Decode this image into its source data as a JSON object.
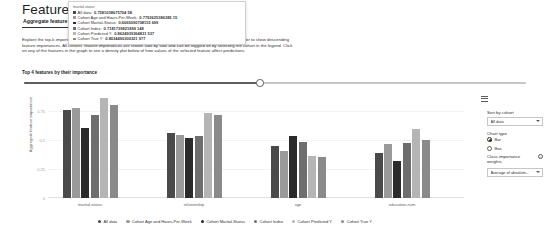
{
  "header": {
    "title": "Feature importances"
  },
  "tabs": [
    {
      "label": "Aggregate feature importance",
      "selected": true
    },
    {
      "label": "Individual feature importance",
      "selected": false
    }
  ],
  "description": "Explore the top-k important features that impact your overall model predictions (a.k.a. global explanation). Use the slider to show descending feature importances. All cohorts' feature importances are shown side by side and can be toggled off by selecting the cohort in the legend. Click on any of the features in the graph to see a density plot below of how values of the selected feature affect predictions.",
  "slider": {
    "label": "Top 4 features by their importance",
    "value": 4,
    "percent": 47
  },
  "tooltip": {
    "header": "marital-status",
    "rows": [
      {
        "series": "All data",
        "value": "0.7581038675704 58",
        "color": "#4a4a4a"
      },
      {
        "series": "Cohort Age and Hours-Per-Week",
        "value": "0.7793625386385 15",
        "color": "#9a9a9a"
      },
      {
        "series": "Cohort Marital-Status",
        "value": "0.6065090708115 699",
        "color": "#2b2b2b"
      },
      {
        "series": "Cohort Index",
        "value": "0.7181739821899 148",
        "color": "#6e6e6e"
      },
      {
        "series": "Cohort Predicted Y",
        "value": "0.8624939364831 537",
        "color": "#b5b5b5"
      },
      {
        "series": "Cohort True Y",
        "value": "0.8034490300321 977",
        "color": "#8a8a8a"
      }
    ]
  },
  "chart_data": {
    "type": "bar",
    "title": "",
    "xlabel": "",
    "ylabel": "Aggregate feature importance",
    "ylim": [
      0,
      0.9
    ],
    "yticks": [
      "0",
      "0.25",
      "0.5",
      "0.75"
    ],
    "ytickvals": [
      0,
      0.25,
      0.5,
      0.75
    ],
    "grid": false,
    "legend_position": "bottom",
    "categories": [
      "marital-status",
      "relationship",
      "age",
      "education-num"
    ],
    "series": [
      {
        "name": "All data",
        "color": "#4a4a4a",
        "values": [
          0.758,
          0.562,
          0.447,
          0.391
        ]
      },
      {
        "name": "Cohort Age and Hours-Per-Week",
        "color": "#9a9a9a",
        "values": [
          0.779,
          0.548,
          0.406,
          0.468
        ]
      },
      {
        "name": "Cohort Marital-Status",
        "color": "#2b2b2b",
        "values": [
          0.607,
          0.52,
          0.538,
          0.318
        ]
      },
      {
        "name": "Cohort Index",
        "color": "#6e6e6e",
        "values": [
          0.718,
          0.541,
          0.481,
          0.478
        ]
      },
      {
        "name": "Cohort Predicted Y",
        "color": "#b5b5b5",
        "values": [
          0.862,
          0.733,
          0.36,
          0.596
        ]
      },
      {
        "name": "Cohort True Y",
        "color": "#8a8a8a",
        "values": [
          0.803,
          0.715,
          0.358,
          0.506
        ]
      }
    ]
  },
  "legend": [
    {
      "label": "All data",
      "color": "#4a4a4a"
    },
    {
      "label": "Cohort Age and Hours-Per-Week",
      "color": "#9a9a9a"
    },
    {
      "label": "Cohort Marital-Status",
      "color": "#2b2b2b"
    },
    {
      "label": "Cohort Index",
      "color": "#6e6e6e"
    },
    {
      "label": "Cohort Predicted Y",
      "color": "#b5b5b5"
    },
    {
      "label": "Cohort True Y",
      "color": "#8a8a8a"
    }
  ],
  "sidebar": {
    "sort_by_cohort_label": "Sort by cohort",
    "sort_by_cohort_value": "All data",
    "chart_type_label": "Chart type",
    "chart_type_options": [
      {
        "label": "Bar",
        "selected": true
      },
      {
        "label": "Box",
        "selected": false
      }
    ],
    "class_weights_label": "Class importance weights",
    "class_weights_value": "Average of absolute...",
    "info_icon": "i"
  }
}
